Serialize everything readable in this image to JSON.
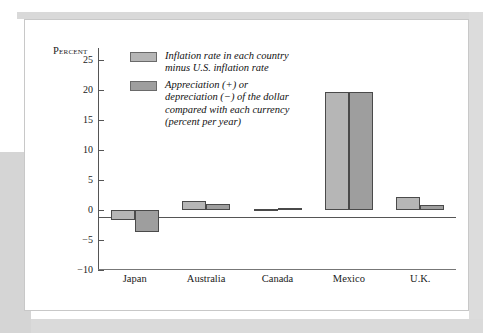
{
  "figure": {
    "panel_name": "chart-figure-panel"
  },
  "chart_data": {
    "type": "bar",
    "title": "",
    "xlabel": "",
    "ylabel": "Percent",
    "ylim": [
      -10,
      27
    ],
    "yticks": [
      25,
      20,
      15,
      10,
      5,
      0,
      -5,
      -10
    ],
    "ytick_labels": [
      "25",
      "20",
      "15",
      "10",
      "5",
      "0",
      "−5",
      "−10"
    ],
    "grid": false,
    "legend_position": "upper-left-inside",
    "categories": [
      "Japan",
      "Australia",
      "Canada",
      "Mexico",
      "U.K."
    ],
    "series": [
      {
        "name": "Inflation rate in each country\nminus U.S. inflation rate",
        "color": "#b6b6b6",
        "values": [
          -1.6,
          1.5,
          0.2,
          19.7,
          2.2
        ]
      },
      {
        "name": "Appreciation (+) or\ndepreciation (−) of the dollar\ncompared with each currency\n(percent per year)",
        "color": "#9e9e9e",
        "values": [
          -3.7,
          1.0,
          0.3,
          19.7,
          0.8
        ]
      }
    ]
  },
  "colors": {
    "series1": "#b6b6b6",
    "series2": "#9e9e9e",
    "bar_border": "#4a4a4a",
    "axis": "#555555",
    "page_gray": "#d9d9d9",
    "panel_background": "#ffffff"
  }
}
